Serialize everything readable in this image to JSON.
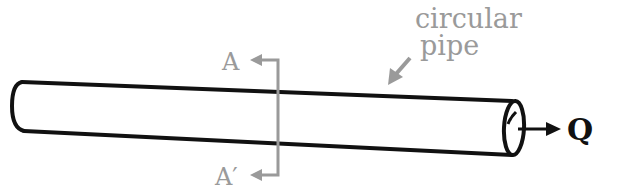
{
  "diagram": {
    "labels": {
      "pipe_label_line1": "circular",
      "pipe_label_line2": "pipe",
      "section_top": "A",
      "section_bottom": "A′",
      "flow": "Q"
    },
    "colors": {
      "pipe_stroke": "#111111",
      "annotation": "#9a9a9a",
      "background": "#ffffff"
    }
  }
}
